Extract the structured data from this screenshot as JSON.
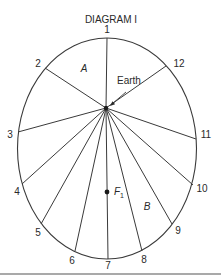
{
  "title": "DIAGRAM I",
  "colors": {
    "stroke": "#3a3a3a",
    "text": "#2a2a2a",
    "background": "#ffffff"
  },
  "ellipse": {
    "cx": 107,
    "cy": 148.5,
    "rx": 89.5,
    "ry": 110.5
  },
  "focus_origin": {
    "x": 106,
    "y": 108
  },
  "positions": [
    {
      "label": "1",
      "x": 107,
      "y": 38,
      "lx": 107,
      "ly": 33
    },
    {
      "label": "2",
      "x": 45,
      "y": 68,
      "lx": 38,
      "ly": 67
    },
    {
      "label": "3",
      "x": 18,
      "y": 132,
      "lx": 10,
      "ly": 138
    },
    {
      "label": "4",
      "x": 22,
      "y": 184,
      "lx": 17,
      "ly": 195
    },
    {
      "label": "5",
      "x": 41,
      "y": 224,
      "lx": 38,
      "ly": 236
    },
    {
      "label": "6",
      "x": 75,
      "y": 251,
      "lx": 72,
      "ly": 264
    },
    {
      "label": "7",
      "x": 108,
      "y": 259,
      "lx": 108,
      "ly": 269
    },
    {
      "label": "8",
      "x": 142,
      "y": 251,
      "lx": 144,
      "ly": 263
    },
    {
      "label": "9",
      "x": 172,
      "y": 224,
      "lx": 178,
      "ly": 234
    },
    {
      "label": "10",
      "x": 193,
      "y": 185,
      "lx": 202,
      "ly": 192
    },
    {
      "label": "11",
      "x": 196,
      "y": 139,
      "lx": 206,
      "ly": 138
    },
    {
      "label": "12",
      "x": 166,
      "y": 66,
      "lx": 179,
      "ly": 67
    }
  ],
  "region_labels": {
    "a": {
      "text": "A",
      "x": 84,
      "y": 72
    },
    "b": {
      "text": "B",
      "x": 147,
      "y": 210
    }
  },
  "earth": {
    "text": "Earth",
    "x": 128,
    "y": 87,
    "pointer_from": {
      "x": 126,
      "y": 92
    },
    "pointer_to": {
      "x": 110,
      "y": 106
    }
  },
  "f1": {
    "label": "F",
    "subscript": "1",
    "x": 107,
    "y": 192
  },
  "baseline": {
    "x1": 0,
    "x2": 221,
    "y": 274
  }
}
